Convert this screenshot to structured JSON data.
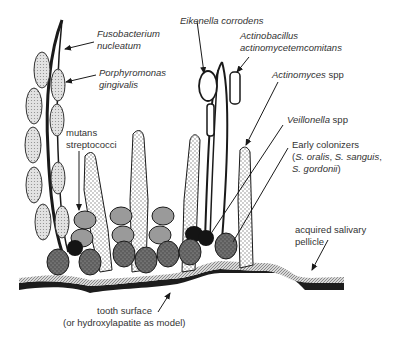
{
  "labels": {
    "fusobacterium_1": "Fusobacterium",
    "fusobacterium_2": "nucleatum",
    "porphyromonas_1": "Porphyromonas",
    "porphyromonas_2": "gingivalis",
    "eikenella": "Eikenella corrodens",
    "actinobacillus_1": "Actinobacillus",
    "actinobacillus_2": "actinomycetemcomitans",
    "actinomyces_italic": "Actinomyces",
    "actinomyces_spp": " spp",
    "veillonella_italic": "Veillonella",
    "veillonella_spp": " spp",
    "mutans_1": "mutans",
    "mutans_2": "streptococci",
    "early_1": "Early colonizers",
    "early_2a": "(",
    "early_2b": "S. oralis",
    "early_2c": ", ",
    "early_2d": "S. sanguis",
    "early_2e": ",",
    "early_3a": "S. gordonii",
    "early_3b": ")",
    "pellicle_1": "acquired salivary",
    "pellicle_2": "pellicle",
    "tooth_1": "tooth surface",
    "tooth_2": "(or hydroxylapatite as model)"
  },
  "colors": {
    "stroke": "#1a1a1a",
    "tooth": "#1c1c1c",
    "early_colonizer": "#6e6e6e",
    "mutans": "#9a9a9a",
    "veillonella": "#141414",
    "rod_fill": "#f4f4f4",
    "pellicle": "#b5b5b5"
  }
}
